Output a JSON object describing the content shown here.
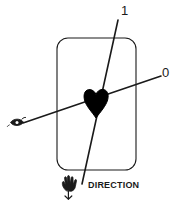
{
  "figure": {
    "name": "heart-projection-direction-diagram",
    "background_color": "#ffffff",
    "stroke_color": "#1a1a1a",
    "fill_color": "#000000",
    "width": 182,
    "height": 212
  },
  "labels": {
    "axis_one": "1",
    "axis_zero": "0",
    "direction": "DIRECTION"
  },
  "icons": {
    "eye": "eye-icon",
    "hand": "hand-icon",
    "heart": "heart-icon",
    "plate": "rounded-rectangle-plate"
  },
  "geometry": {
    "plate": {
      "x": 57,
      "y": 38,
      "width": 79,
      "height": 132,
      "corner_radius": 11
    },
    "heart": {
      "center_x": 96,
      "center_y": 103,
      "width": 23,
      "height": 29
    },
    "line_one": {
      "x1": 118,
      "y1": 20,
      "x2": 82,
      "y2": 184
    },
    "line_zero": {
      "x1": 23,
      "y1": 123,
      "x2": 161,
      "y2": 76
    },
    "eye_marker": {
      "x": 11,
      "y": 118
    },
    "hand_marker": {
      "x": 63,
      "y": 181
    }
  }
}
